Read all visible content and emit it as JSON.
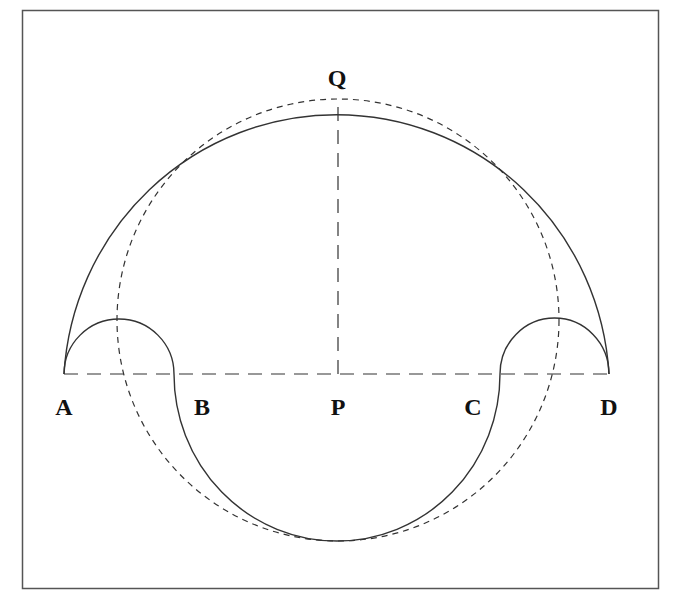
{
  "diagram": {
    "frame": {
      "x": 22,
      "y": 10,
      "width": 636,
      "height": 578,
      "stroke": "#555555"
    },
    "stroke_color": "#333333",
    "points": {
      "A": {
        "label": "A",
        "x": 64,
        "y": 374
      },
      "B": {
        "label": "B",
        "x": 174,
        "y": 374
      },
      "P": {
        "label": "P",
        "x": 338,
        "y": 374
      },
      "C": {
        "label": "C",
        "x": 500,
        "y": 374
      },
      "D": {
        "label": "D",
        "x": 609,
        "y": 374
      },
      "Q": {
        "label": "Q",
        "x": 338,
        "y": 98
      }
    },
    "labels": [
      {
        "text": "Q",
        "x": 337,
        "y": 86
      },
      {
        "text": "A",
        "x": 64,
        "y": 415
      },
      {
        "text": "B",
        "x": 202,
        "y": 415
      },
      {
        "text": "P",
        "x": 338,
        "y": 415
      },
      {
        "text": "C",
        "x": 473,
        "y": 415
      },
      {
        "text": "D",
        "x": 609,
        "y": 415
      }
    ],
    "shapes": {
      "outer_arc": {
        "style": "solid",
        "from": "A",
        "to": "D",
        "through": "Q",
        "description": "large upper semicircle arc"
      },
      "left_small_arc": {
        "style": "solid",
        "from": "A",
        "to": "B",
        "apex_y": 319
      },
      "right_small_arc": {
        "style": "solid",
        "from": "C",
        "to": "D",
        "apex_y": 318
      },
      "lower_arc": {
        "style": "solid",
        "from": "B",
        "to": "C",
        "bottom_y": 541
      },
      "dashed_circle": {
        "style": "dashed",
        "cx": 338,
        "cy": 320,
        "r": 221
      },
      "baseline": {
        "style": "dashed",
        "from": "A",
        "to": "D"
      },
      "radius_PQ": {
        "style": "dashed",
        "from": "P",
        "to": "Q"
      }
    }
  }
}
